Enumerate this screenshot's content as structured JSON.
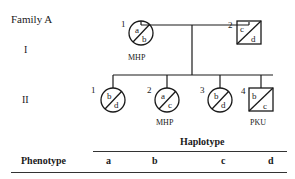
{
  "family_title": "Family A",
  "generations": [
    {
      "label": "I"
    },
    {
      "label": "II"
    }
  ],
  "individuals": [
    {
      "gen": "I",
      "num": "1",
      "sex": "female",
      "haplotypes": [
        "a",
        "b"
      ],
      "phenotype": "MHP"
    },
    {
      "gen": "I",
      "num": "2",
      "sex": "male",
      "haplotypes": [
        "c",
        "d"
      ],
      "phenotype": ""
    },
    {
      "gen": "II",
      "num": "1",
      "sex": "female",
      "haplotypes": [
        "b",
        "d"
      ],
      "phenotype": ""
    },
    {
      "gen": "II",
      "num": "2",
      "sex": "female",
      "haplotypes": [
        "a",
        "c"
      ],
      "phenotype": "MHP"
    },
    {
      "gen": "II",
      "num": "3",
      "sex": "female",
      "haplotypes": [
        "b",
        "d"
      ],
      "phenotype": ""
    },
    {
      "gen": "II",
      "num": "4",
      "sex": "male",
      "haplotypes": [
        "b",
        "c"
      ],
      "phenotype": "PKU"
    }
  ],
  "table": {
    "group_header": "Haplotype",
    "row_header": "Phenotype",
    "columns": [
      "a",
      "b",
      "c",
      "d"
    ]
  }
}
